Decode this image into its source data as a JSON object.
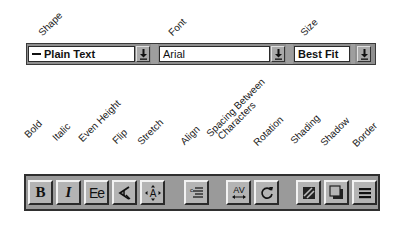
{
  "top_labels": {
    "shape": "Shape",
    "font": "Font",
    "size": "Size"
  },
  "top_toolbar": {
    "shape": {
      "value": "Plain Text",
      "icon": "straight-line-shape-icon"
    },
    "font": {
      "value": "Arial"
    },
    "size": {
      "value": "Best Fit"
    },
    "dropdown_icon": "down-arrow-icon"
  },
  "bottom_labels": {
    "bold": "Bold",
    "italic": "Italic",
    "even_height": "Even Height",
    "flip": "Flip",
    "stretch": "Stretch",
    "align": "Align",
    "spacing_line1": "Spacing Between",
    "spacing_line2": "Characters",
    "rotation": "Rotation",
    "shading": "Shading",
    "shadow": "Shadow",
    "border": "Border"
  },
  "bottom_toolbar": {
    "buttons": [
      {
        "id": "bold",
        "glyph": "B",
        "icon": "bold-icon"
      },
      {
        "id": "italic",
        "glyph": "I",
        "icon": "italic-icon"
      },
      {
        "id": "even-height",
        "glyph": "Ee",
        "icon": "even-height-icon"
      },
      {
        "id": "flip",
        "icon": "flip-icon"
      },
      {
        "id": "stretch",
        "icon": "stretch-icon"
      },
      {
        "id": "align",
        "icon": "align-icon"
      },
      {
        "id": "spacing",
        "glyph": "AV",
        "icon": "character-spacing-icon"
      },
      {
        "id": "rotation",
        "icon": "rotation-icon"
      },
      {
        "id": "shading",
        "icon": "shading-icon"
      },
      {
        "id": "shadow",
        "icon": "shadow-icon"
      },
      {
        "id": "border",
        "icon": "border-icon"
      }
    ]
  },
  "colors": {
    "toolbar_bg": "#9a9a9a",
    "button_face": "#b4b4b4",
    "field_bg": "#ffffff"
  }
}
